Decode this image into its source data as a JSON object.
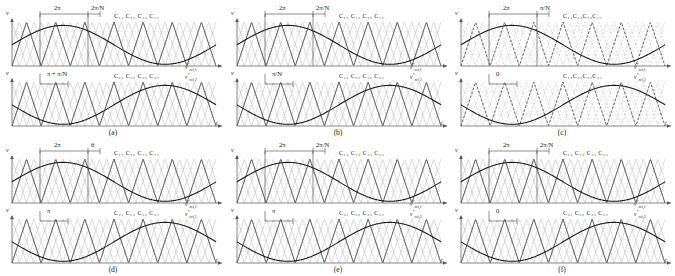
{
  "figure": {
    "width": 675,
    "height": 276,
    "background": "#ffffff",
    "carrier_color": "#b9b9b9",
    "carrier_dark_color": "#3a3a3a",
    "reference_color": "#1a1a1a",
    "axis_color": "#555555",
    "gridline_color": "#cfcfcf",
    "axis_label_y": "v",
    "axis_label_x": "t"
  },
  "panels": [
    {
      "id": "a",
      "caption": "(a)",
      "top": {
        "carrier_labels": [
          "C11",
          "C12",
          "C13",
          "C14"
        ],
        "carrier_labels_text": "C₁₁  C₁₂  C₁₃  C₁₄",
        "vref_label": "v*ref,1",
        "span_label": "2π",
        "offset_label": "2π/N",
        "n_carriers": 4,
        "carrier_style": "solid",
        "reference_phase": 0
      },
      "bottom": {
        "carrier_labels": [
          "C21",
          "C22",
          "C23",
          "C24"
        ],
        "carrier_labels_text": "C₂₁  C₂₂  C₂₃  C₂₄",
        "vref_label": "v*ref,2",
        "shift_label": "π + π/N",
        "n_carriers": 4,
        "carrier_style": "solid",
        "reference_phase": 180
      }
    },
    {
      "id": "b",
      "caption": "(b)",
      "top": {
        "carrier_labels": [
          "C11",
          "C12",
          "C13",
          "C14"
        ],
        "carrier_labels_text": "C₁₁  C₁₂  C₁₃  C₁₄",
        "vref_label": "v*ref,1",
        "span_label": "2π",
        "offset_label": "2π/N",
        "n_carriers": 4,
        "carrier_style": "solid",
        "reference_phase": 0
      },
      "bottom": {
        "carrier_labels": [
          "C21",
          "C22",
          "C23",
          "C24"
        ],
        "carrier_labels_text": "C₂₁  C₂₂  C₂₃  C₂₄",
        "vref_label": "v*ref,2",
        "shift_label": "π/N",
        "n_carriers": 4,
        "carrier_style": "solid",
        "reference_phase": 180
      }
    },
    {
      "id": "c",
      "caption": "(c)",
      "top": {
        "carrier_labels": [
          "C11",
          "C12",
          "C13",
          "C14"
        ],
        "carrier_labels_text": "C₁₁C₁₂C₁₃C₁₄",
        "vref_label": "v*ref,1",
        "span_label": "2π",
        "offset_label": "π/N",
        "n_carriers": 4,
        "carrier_style": "dashed",
        "reference_phase": 0
      },
      "bottom": {
        "carrier_labels": [
          "C21",
          "C22",
          "C23",
          "C24"
        ],
        "carrier_labels_text": "C₂₁C₂₂C₂₃C₂₄",
        "vref_label": "v*ref,2",
        "shift_label": "0",
        "n_carriers": 4,
        "carrier_style": "dashed",
        "reference_phase": 180
      }
    },
    {
      "id": "d",
      "caption": "(d)",
      "top": {
        "carrier_labels": [
          "C11",
          "C12",
          "C13",
          "C14"
        ],
        "carrier_labels_text": "C₁₁  C₁₂  C₁₃  C₁₄",
        "vref_label": "v*ref,1",
        "span_label": "2π",
        "offset_label": "θ",
        "n_carriers": 4,
        "carrier_style": "solid",
        "reference_phase": 0
      },
      "bottom": {
        "carrier_labels": [
          "C21",
          "C22",
          "C23",
          "C24"
        ],
        "carrier_labels_text": "C₂₁  C₂₂  C₂₃  C₂₄",
        "vref_label": "v*ref,2",
        "shift_label": "π",
        "n_carriers": 4,
        "carrier_style": "solid",
        "reference_phase": 180
      }
    },
    {
      "id": "e",
      "caption": "(e)",
      "top": {
        "carrier_labels": [
          "C11",
          "C12",
          "C13",
          "C14"
        ],
        "carrier_labels_text": "C₁₁  C₁₂  C₁₃  C₁₄",
        "vref_label": "v*ref,1",
        "span_label": "2π",
        "offset_label": "2π/N",
        "n_carriers": 4,
        "carrier_style": "solid",
        "reference_phase": 0
      },
      "bottom": {
        "carrier_labels": [
          "C21",
          "C22",
          "C23",
          "C24"
        ],
        "carrier_labels_text": "C₂₁  C₂₂  C₂₃  C₂₄",
        "vref_label": "v*ref,2",
        "shift_label": "π",
        "n_carriers": 4,
        "carrier_style": "solid",
        "reference_phase": 180
      }
    },
    {
      "id": "f",
      "caption": "(f)",
      "top": {
        "carrier_labels": [
          "C11",
          "C12",
          "C13",
          "C14"
        ],
        "carrier_labels_text": "C₁₁  C₁₂  C₁₃  C₁₄",
        "vref_label": "v*ref,1",
        "span_label": "2π",
        "offset_label": "2π/N",
        "n_carriers": 4,
        "carrier_style": "solid",
        "reference_phase": 0
      },
      "bottom": {
        "carrier_labels": [
          "C21",
          "C22",
          "C23",
          "C24"
        ],
        "carrier_labels_text": "C₂₁  C₂₂  C₂₃  C₂₄",
        "vref_label": "v*ref,2",
        "shift_label": "0",
        "n_carriers": 4,
        "carrier_style": "solid",
        "reference_phase": 180
      }
    }
  ],
  "chart_data": {
    "type": "line",
    "title": "",
    "xlabel": "t",
    "ylabel": "v",
    "grid": true,
    "legend": "none",
    "x": [
      0,
      0.25,
      0.5,
      0.75,
      1
    ],
    "series": [
      {
        "name": "v*ref,1",
        "values": [
          0,
          1,
          0,
          -1,
          0
        ]
      },
      {
        "name": "v*ref,2",
        "values": [
          0,
          -1,
          0,
          1,
          0
        ]
      },
      {
        "name": "carrier-triangular",
        "values": [
          -1,
          1,
          -1,
          1,
          -1
        ]
      }
    ],
    "ylim": [
      -1,
      1
    ],
    "xlim": [
      0,
      1
    ]
  }
}
